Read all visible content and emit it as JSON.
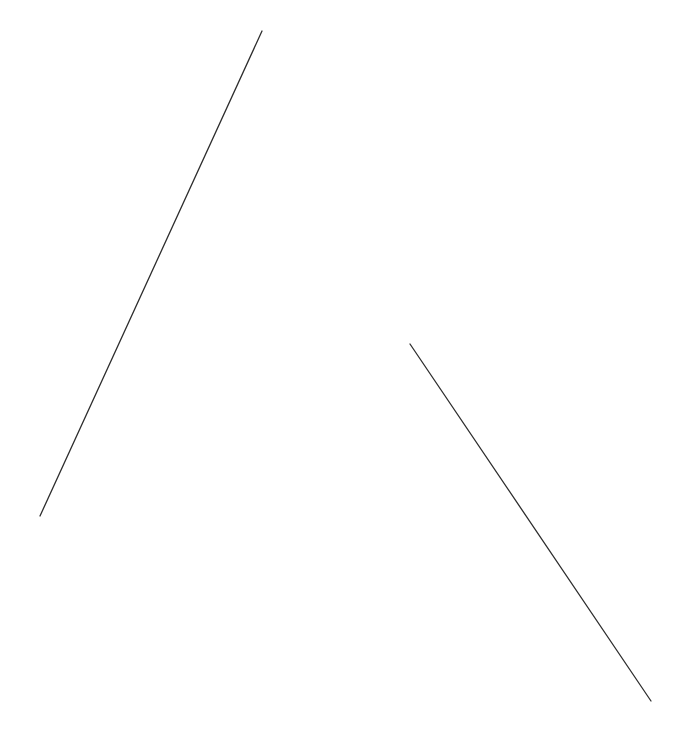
{
  "canvas": {
    "width": 686,
    "height": 731,
    "background": "#ffffff"
  },
  "lines": [
    {
      "x1": 262,
      "y1": 31,
      "x2": 40,
      "y2": 516,
      "color": "#2e2e2e",
      "width": 1.3
    },
    {
      "x1": 410,
      "y1": 344,
      "x2": 651,
      "y2": 701,
      "color": "#2e2e2e",
      "width": 1.3
    }
  ]
}
